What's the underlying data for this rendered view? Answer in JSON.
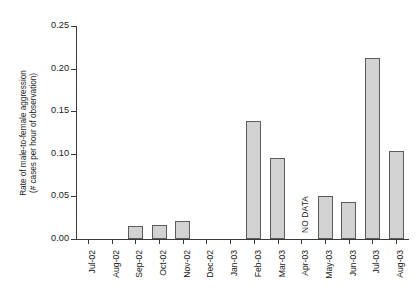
{
  "chart_data": {
    "type": "bar",
    "title": "",
    "xlabel": "",
    "ylabel_line1": "Rate of male-to-female aggression",
    "ylabel_line2": "(# cases per hour of observation)",
    "categories": [
      "Jul-02",
      "Aug-02",
      "Sep-02",
      "Oct-02",
      "Nov-02",
      "Dec-02",
      "Jan-03",
      "Feb-03",
      "Mar-03",
      "Apr-03",
      "May-03",
      "Jun-03",
      "Jul-03",
      "Aug-03"
    ],
    "values": [
      0,
      0,
      0.0155,
      0.017,
      0.021,
      0,
      0,
      0.139,
      0.095,
      null,
      0.05,
      0.044,
      0.212,
      0.103
    ],
    "ylim": [
      0,
      0.25
    ],
    "yticks": [
      0.0,
      0.05,
      0.1,
      0.15,
      0.2,
      0.25
    ],
    "ytick_labels": [
      "0.00",
      "0.05",
      "0.10",
      "0.15",
      "0.20",
      "0.25"
    ],
    "grid": false,
    "legend": false,
    "annotations": [
      {
        "text": "NO DATA",
        "category": "Apr-03",
        "rotation": -90
      }
    ],
    "bar_fill_color": "#d2d2d2",
    "bar_border_color": "#5c5c5c",
    "axis_color": "#3a3a3a",
    "background_color": "#ffffff"
  }
}
